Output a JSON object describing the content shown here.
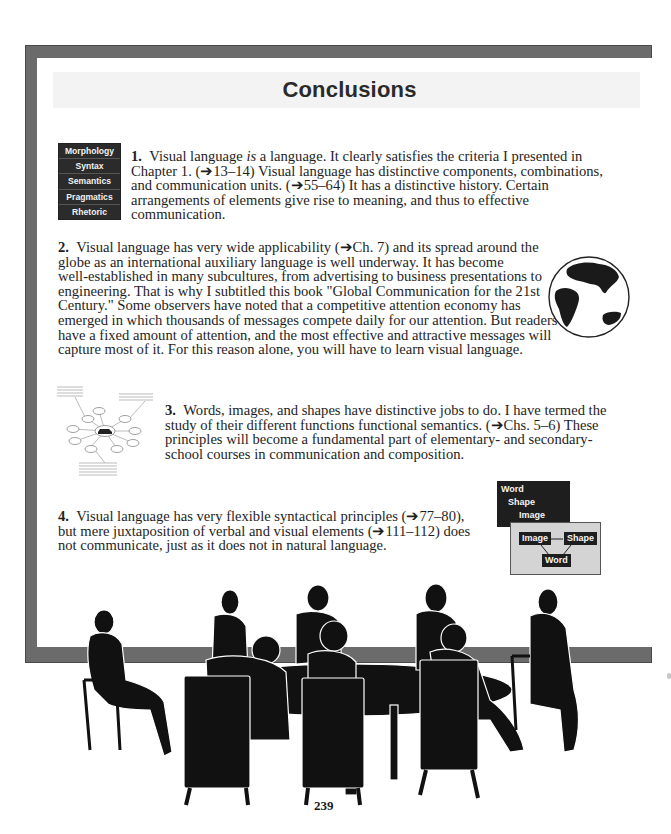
{
  "page": {
    "title": "Conclusions",
    "page_number": "239"
  },
  "levels_box": {
    "items": [
      "Morphology",
      "Syntax",
      "Semantics",
      "Pragmatics",
      "Rhetoric"
    ]
  },
  "conclusions": [
    {
      "number": "1.",
      "lines": [
        [
          "Visual language ",
          "is",
          " a language.  It clearly satisfies the criteria I presented in"
        ],
        "Chapter 1. (➔13–14)  Visual language has distinctive components, combinations,",
        "and communication units. (➔55–64)  It has a distinctive history.  Certain",
        "arrangements of elements give rise to meaning, and thus to effective",
        "communication."
      ]
    },
    {
      "number": "2.",
      "lines": [
        "Visual language has very wide applicability (➔Ch. 7) and its spread around the",
        "globe as an international auxiliary language is well underway.  It has become",
        "well-established in many subcultures, from advertising to business presentations to",
        "engineering.  That is why I subtitled this book \"Global Communication for the 21st",
        "Century.\"  Some observers have noted that a competitive attention economy has",
        "emerged in which thousands of messages compete daily for our attention.  But readers",
        "have a fixed amount of attention, and the most effective and attractive messages will",
        "capture most of it.  For this reason alone, you will have to learn visual language."
      ]
    },
    {
      "number": "3.",
      "lines": [
        "Words, images, and shapes have distinctive jobs to do.  I have termed the",
        "study of their different functions functional semantics. (➔Chs. 5–6)  These",
        "principles will become a fundamental part of elementary- and secondary-",
        "school courses in communication and composition."
      ]
    },
    {
      "number": "4.",
      "lines": [
        "Visual language has very flexible syntactical principles (➔77–80),",
        "but mere juxtaposition of verbal and visual elements (➔111–112) does",
        "not communicate, just as it does not in natural language."
      ]
    }
  ],
  "wsi_diagram": {
    "stack": [
      "Word",
      "Shape",
      "Image"
    ],
    "linked": {
      "left": "Image",
      "right": "Shape",
      "bottom": "Word"
    }
  },
  "colors": {
    "frame": "#6b6b6b",
    "title_band": "#f3f3f3",
    "dark_box": "#2b2b2b",
    "light_box": "#d4d4d4"
  }
}
